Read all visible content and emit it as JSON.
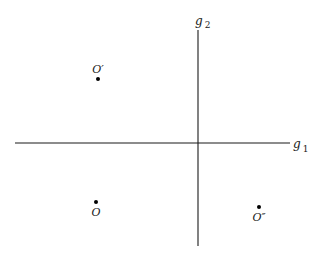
{
  "diagram": {
    "type": "coordinate-plane-points",
    "axes": {
      "horizontal": {
        "label": "g",
        "subscript": "1"
      },
      "vertical": {
        "label": "g",
        "subscript": "2"
      }
    },
    "points": [
      {
        "id": "o-prime",
        "label": "O′",
        "quadrant": "upper-left"
      },
      {
        "id": "o",
        "label": "O",
        "quadrant": "lower-left"
      },
      {
        "id": "o-double-prime",
        "label": "O″",
        "quadrant": "lower-right"
      }
    ],
    "colors": {
      "ink": "#1a1a1a",
      "background": "#ffffff"
    }
  }
}
